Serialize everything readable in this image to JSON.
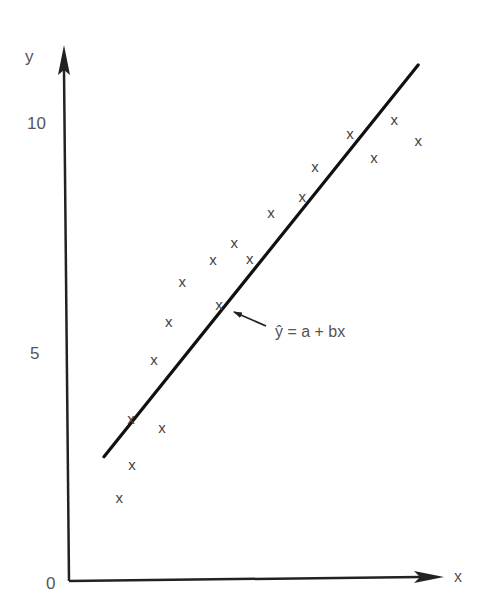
{
  "chart_data": {
    "type": "scatter",
    "title": "",
    "xlabel": "x",
    "ylabel": "y",
    "y_ticks": [
      0,
      5,
      10
    ],
    "y_tick_labels": [
      "0",
      "5",
      "10"
    ],
    "x_ticks": [],
    "ylim": [
      0,
      11.3
    ],
    "xlim": [
      0,
      8.2
    ],
    "grid": false,
    "marker": "x",
    "points": [
      {
        "x": 1.09,
        "y": 1.8
      },
      {
        "x": 1.37,
        "y": 2.52
      },
      {
        "x": 1.35,
        "y": 3.52
      },
      {
        "x": 2.02,
        "y": 3.33
      },
      {
        "x": 1.85,
        "y": 4.8
      },
      {
        "x": 2.17,
        "y": 5.63
      },
      {
        "x": 2.46,
        "y": 6.5
      },
      {
        "x": 3.26,
        "y": 6.0
      },
      {
        "x": 3.13,
        "y": 6.98
      },
      {
        "x": 3.59,
        "y": 7.35
      },
      {
        "x": 3.93,
        "y": 7.0
      },
      {
        "x": 4.39,
        "y": 8.0
      },
      {
        "x": 5.07,
        "y": 8.35
      },
      {
        "x": 5.35,
        "y": 9.0
      },
      {
        "x": 6.11,
        "y": 9.72
      },
      {
        "x": 6.63,
        "y": 9.2
      },
      {
        "x": 7.07,
        "y": 10.02
      },
      {
        "x": 7.59,
        "y": 9.57
      }
    ],
    "regression_line": {
      "label": "ŷ = a + bx",
      "start": {
        "x": 0.76,
        "y": 2.7
      },
      "end": {
        "x": 7.59,
        "y": 11.22
      }
    },
    "annotations": [
      {
        "text": "ŷ = a + bx",
        "arrow_to": {
          "x": 3.52,
          "y": 5.85
        }
      }
    ]
  }
}
